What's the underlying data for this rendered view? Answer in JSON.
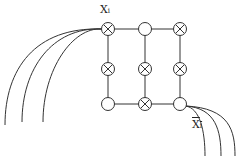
{
  "labels": {
    "top": {
      "main": "X",
      "sub": "i"
    },
    "bottom": {
      "main": "X",
      "sub": "i",
      "overline": true
    }
  },
  "grid": {
    "rows": 3,
    "cols": 3,
    "nodes": [
      [
        "crossed",
        "empty",
        "crossed"
      ],
      [
        "crossed",
        "crossed",
        "crossed"
      ],
      [
        "empty",
        "crossed",
        "empty"
      ]
    ]
  },
  "colors": {
    "stroke": "#333333",
    "background": "#ffffff"
  }
}
